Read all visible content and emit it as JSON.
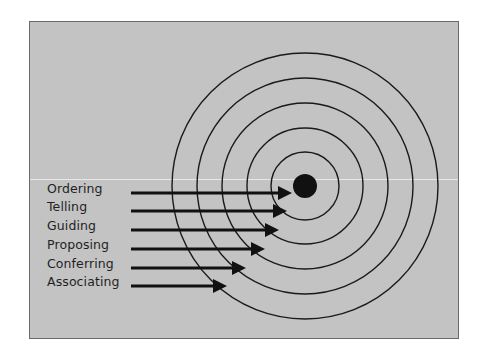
{
  "diagram": {
    "type": "concentric-target",
    "background_color": "#c3c3c3",
    "target": {
      "center": [
        305,
        186
      ],
      "bullseye_radius": 12,
      "ring_radii": [
        34,
        58,
        83,
        108,
        133
      ],
      "ring_color": "#1a1a1a",
      "bullseye_color": "#111111"
    },
    "arrows": [
      {
        "label": "Ordering",
        "y": 193,
        "x_start": 131,
        "x_tip": 292
      },
      {
        "label": "Telling",
        "y": 211,
        "x_start": 131,
        "x_tip": 287
      },
      {
        "label": "Guiding",
        "y": 230,
        "x_start": 131,
        "x_tip": 279
      },
      {
        "label": "Proposing",
        "y": 249,
        "x_start": 131,
        "x_tip": 265
      },
      {
        "label": "Conferring",
        "y": 268,
        "x_start": 131,
        "x_tip": 246
      },
      {
        "label": "Associating",
        "y": 286,
        "x_start": 131,
        "x_tip": 227
      }
    ]
  },
  "labels": {
    "0": "Ordering",
    "1": "Telling",
    "2": "Guiding",
    "3": "Proposing",
    "4": "Conferring",
    "5": "Associating"
  }
}
